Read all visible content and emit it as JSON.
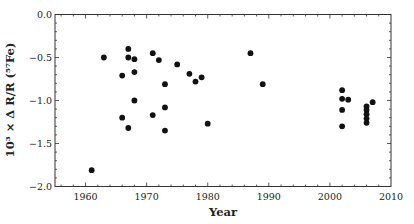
{
  "chart_data": {
    "type": "scatter",
    "title": "",
    "xlabel": "Year",
    "ylabel": "10³ × Δ R/R (⁵⁷Fe)",
    "xlim": [
      1955,
      2010
    ],
    "ylim": [
      -2.0,
      0.0
    ],
    "xticks": [
      1960,
      1970,
      1980,
      1990,
      2000,
      2010
    ],
    "xtick_labels": [
      "1960",
      "1970",
      "1980",
      "1990",
      "2000",
      "2010"
    ],
    "yticks": [
      0.0,
      -0.5,
      -1.0,
      -1.5,
      -2.0
    ],
    "ytick_labels": [
      "0.0",
      "−0.5",
      "−1.0",
      "−1.5",
      "−2.0"
    ],
    "grid": false,
    "legend": null,
    "series": [
      {
        "name": "data",
        "color": "#111111",
        "points": [
          {
            "x": 1961,
            "y": -1.81
          },
          {
            "x": 1963,
            "y": -0.5
          },
          {
            "x": 1966,
            "y": -0.71
          },
          {
            "x": 1966,
            "y": -1.2
          },
          {
            "x": 1967,
            "y": -0.4
          },
          {
            "x": 1967,
            "y": -0.5
          },
          {
            "x": 1967,
            "y": -1.32
          },
          {
            "x": 1968,
            "y": -0.52
          },
          {
            "x": 1968,
            "y": -0.67
          },
          {
            "x": 1968,
            "y": -1.0
          },
          {
            "x": 1971,
            "y": -0.45
          },
          {
            "x": 1971,
            "y": -1.17
          },
          {
            "x": 1972,
            "y": -0.53
          },
          {
            "x": 1973,
            "y": -0.81
          },
          {
            "x": 1973,
            "y": -1.08
          },
          {
            "x": 1973,
            "y": -1.35
          },
          {
            "x": 1975,
            "y": -0.58
          },
          {
            "x": 1977,
            "y": -0.69
          },
          {
            "x": 1978,
            "y": -0.78
          },
          {
            "x": 1979,
            "y": -0.73
          },
          {
            "x": 1980,
            "y": -1.27
          },
          {
            "x": 1987,
            "y": -0.45
          },
          {
            "x": 1989,
            "y": -0.81
          },
          {
            "x": 2002,
            "y": -0.88
          },
          {
            "x": 2002,
            "y": -0.98
          },
          {
            "x": 2002,
            "y": -1.11
          },
          {
            "x": 2002,
            "y": -1.3
          },
          {
            "x": 2003,
            "y": -0.99
          },
          {
            "x": 2006,
            "y": -1.07
          },
          {
            "x": 2006,
            "y": -1.11
          },
          {
            "x": 2006,
            "y": -1.16
          },
          {
            "x": 2006,
            "y": -1.21
          },
          {
            "x": 2006,
            "y": -1.26
          },
          {
            "x": 2007,
            "y": -1.02
          }
        ]
      }
    ]
  }
}
